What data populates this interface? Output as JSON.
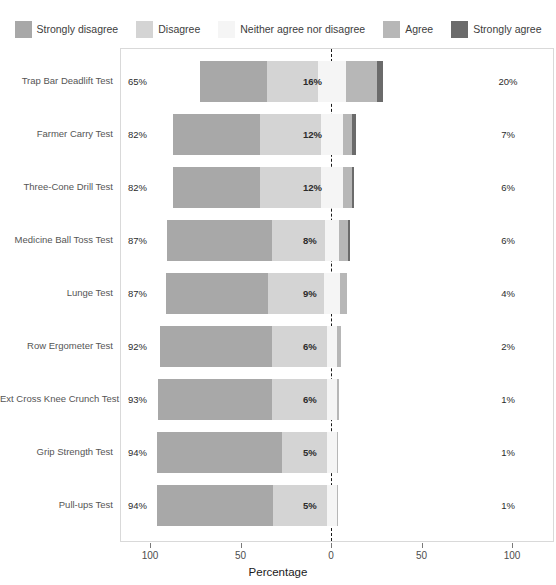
{
  "chart_data": {
    "type": "bar",
    "subtype": "diverging-stacked-likert",
    "title": "",
    "xlabel": "Percentage",
    "ylabel": "",
    "xlim": [
      -100,
      100
    ],
    "xticks": [
      -100,
      -50,
      0,
      50,
      100
    ],
    "xtick_labels": [
      "100",
      "50",
      "0",
      "50",
      "100"
    ],
    "grid": false,
    "legend_position": "top",
    "legend": [
      {
        "label": "Strongly disagree",
        "color": "#a8a8a8"
      },
      {
        "label": "Disagree",
        "color": "#d4d4d4"
      },
      {
        "label": "Neither agree nor disagree",
        "color": "#f5f5f5"
      },
      {
        "label": "Agree",
        "color": "#b7b7b7"
      },
      {
        "label": "Strongly agree",
        "color": "#6b6b6b"
      }
    ],
    "categories": [
      "Trap Bar Deadlift Test",
      "Farmer Carry Test",
      "Three-Cone Drill Test",
      "Medicine Ball Toss Test",
      "Lunge Test",
      "Row Ergometer Test",
      "Ext Cross Knee Crunch Test",
      "Grip Strength Test",
      "Pull-ups Test"
    ],
    "series": [
      {
        "name": "Strongly disagree",
        "values": [
          37,
          48,
          48,
          58,
          56,
          62,
          63,
          69,
          64
        ]
      },
      {
        "name": "Disagree",
        "values": [
          28,
          34,
          34,
          29,
          31,
          30,
          30,
          25,
          30
        ]
      },
      {
        "name": "Neither agree nor disagree",
        "values": [
          16,
          12,
          12,
          8,
          9,
          6,
          6,
          5,
          5
        ]
      },
      {
        "name": "Agree",
        "values": [
          17,
          5,
          5,
          5,
          4,
          2,
          1,
          1,
          1
        ]
      },
      {
        "name": "Strongly agree",
        "values": [
          3,
          2,
          1,
          1,
          0,
          0,
          0,
          0,
          0
        ]
      }
    ],
    "rows": [
      {
        "category": "Trap Bar Deadlift Test",
        "left_label": "65%",
        "mid_label": "16%",
        "right_label": "20%",
        "strongly_disagree": 37,
        "disagree": 28,
        "neutral": 16,
        "agree": 17,
        "strongly_agree": 3
      },
      {
        "category": "Farmer Carry Test",
        "left_label": "82%",
        "mid_label": "12%",
        "right_label": "7%",
        "strongly_disagree": 48,
        "disagree": 34,
        "neutral": 12,
        "agree": 5,
        "strongly_agree": 2
      },
      {
        "category": "Three-Cone Drill Test",
        "left_label": "82%",
        "mid_label": "12%",
        "right_label": "6%",
        "strongly_disagree": 48,
        "disagree": 34,
        "neutral": 12,
        "agree": 5,
        "strongly_agree": 1
      },
      {
        "category": "Medicine Ball Toss Test",
        "left_label": "87%",
        "mid_label": "8%",
        "right_label": "6%",
        "strongly_disagree": 58,
        "disagree": 29,
        "neutral": 8,
        "agree": 5,
        "strongly_agree": 1
      },
      {
        "category": "Lunge Test",
        "left_label": "87%",
        "mid_label": "9%",
        "right_label": "4%",
        "strongly_disagree": 56,
        "disagree": 31,
        "neutral": 9,
        "agree": 4,
        "strongly_agree": 0
      },
      {
        "category": "Row Ergometer Test",
        "left_label": "92%",
        "mid_label": "6%",
        "right_label": "2%",
        "strongly_disagree": 62,
        "disagree": 30,
        "neutral": 6,
        "agree": 2,
        "strongly_agree": 0
      },
      {
        "category": "Ext Cross Knee Crunch Test",
        "left_label": "93%",
        "mid_label": "6%",
        "right_label": "1%",
        "strongly_disagree": 63,
        "disagree": 30,
        "neutral": 6,
        "agree": 1,
        "strongly_agree": 0
      },
      {
        "category": "Grip Strength Test",
        "left_label": "94%",
        "mid_label": "5%",
        "right_label": "1%",
        "strongly_disagree": 69,
        "disagree": 25,
        "neutral": 5,
        "agree": 1,
        "strongly_agree": 0
      },
      {
        "category": "Pull-ups Test",
        "left_label": "94%",
        "mid_label": "5%",
        "right_label": "1%",
        "strongly_disagree": 64,
        "disagree": 30,
        "neutral": 5,
        "agree": 1,
        "strongly_agree": 0
      }
    ]
  }
}
